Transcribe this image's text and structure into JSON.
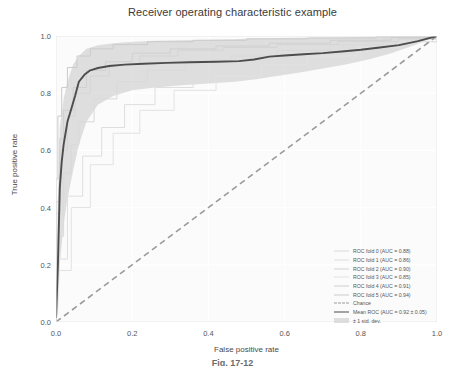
{
  "figure": {
    "caption": "Fig. 17-12"
  },
  "chart_data": {
    "type": "line",
    "title": "Receiver operating characteristic example",
    "xlabel": "False positive rate",
    "ylabel": "True positive rate",
    "xlim": [
      0.0,
      1.0
    ],
    "ylim": [
      0.0,
      1.0
    ],
    "xticks": [
      "0.0",
      "0.2",
      "0.4",
      "0.6",
      "0.8",
      "1.0"
    ],
    "xtick_values": [
      0.0,
      0.2,
      0.4,
      0.6,
      0.8,
      1.0
    ],
    "yticks": [
      "0.0",
      "0.2",
      "0.4",
      "0.6",
      "0.8",
      "1.0"
    ],
    "ytick_values": [
      0.0,
      0.2,
      0.4,
      0.6,
      0.8,
      1.0
    ],
    "grid": true,
    "legend_position": "lower right",
    "series": [
      {
        "name": "ROC fold 0 (AUC = 0.88)",
        "auc": 0.88,
        "style": "solid-light",
        "color": "#d9d9d9",
        "x": [
          0.0,
          0.0,
          0.02,
          0.04,
          0.06,
          0.1,
          0.16,
          0.24,
          0.34,
          0.46,
          0.58,
          0.72,
          0.86,
          1.0
        ],
        "y": [
          0.0,
          0.3,
          0.52,
          0.62,
          0.7,
          0.78,
          0.84,
          0.88,
          0.91,
          0.93,
          0.95,
          0.97,
          0.99,
          1.0
        ]
      },
      {
        "name": "ROC fold 1 (AUC = 0.86)",
        "auc": 0.86,
        "style": "solid-light",
        "color": "#dedede",
        "x": [
          0.0,
          0.0,
          0.03,
          0.07,
          0.12,
          0.18,
          0.26,
          0.36,
          0.48,
          0.6,
          0.74,
          0.88,
          1.0
        ],
        "y": [
          0.0,
          0.22,
          0.44,
          0.58,
          0.68,
          0.76,
          0.82,
          0.87,
          0.9,
          0.93,
          0.96,
          0.98,
          1.0
        ]
      },
      {
        "name": "ROC fold 2 (AUC = 0.90)",
        "auc": 0.9,
        "style": "solid-light",
        "color": "#d4d4d4",
        "x": [
          0.0,
          0.0,
          0.01,
          0.03,
          0.05,
          0.09,
          0.14,
          0.22,
          0.32,
          0.44,
          0.58,
          0.74,
          0.9,
          1.0
        ],
        "y": [
          0.0,
          0.38,
          0.6,
          0.72,
          0.8,
          0.86,
          0.9,
          0.93,
          0.95,
          0.96,
          0.97,
          0.98,
          0.99,
          1.0
        ]
      },
      {
        "name": "ROC fold 3 (AUC = 0.85)",
        "auc": 0.85,
        "style": "solid-light",
        "color": "#e2e2e2",
        "x": [
          0.0,
          0.0,
          0.04,
          0.09,
          0.15,
          0.22,
          0.31,
          0.42,
          0.54,
          0.66,
          0.79,
          0.9,
          1.0
        ],
        "y": [
          0.0,
          0.18,
          0.4,
          0.55,
          0.66,
          0.74,
          0.81,
          0.86,
          0.9,
          0.93,
          0.96,
          0.98,
          1.0
        ]
      },
      {
        "name": "ROC fold 4 (AUC = 0.91)",
        "auc": 0.91,
        "style": "solid-light",
        "color": "#d0d0d0",
        "x": [
          0.0,
          0.0,
          0.01,
          0.02,
          0.045,
          0.08,
          0.13,
          0.2,
          0.3,
          0.42,
          0.56,
          0.72,
          0.88,
          1.0
        ],
        "y": [
          0.0,
          0.42,
          0.64,
          0.74,
          0.82,
          0.88,
          0.91,
          0.94,
          0.955,
          0.965,
          0.975,
          0.985,
          0.995,
          1.0
        ]
      },
      {
        "name": "ROC fold 5 (AUC = 0.94)",
        "auc": 0.94,
        "style": "solid-light",
        "color": "#cbcbcb",
        "x": [
          0.0,
          0.0,
          0.005,
          0.015,
          0.03,
          0.055,
          0.09,
          0.15,
          0.24,
          0.36,
          0.5,
          0.66,
          0.84,
          1.0
        ],
        "y": [
          0.0,
          0.5,
          0.72,
          0.82,
          0.89,
          0.93,
          0.955,
          0.97,
          0.98,
          0.985,
          0.99,
          0.993,
          0.997,
          1.0
        ]
      },
      {
        "name": "Chance",
        "style": "dashed",
        "color": "#9a9a9a",
        "x": [
          0.0,
          1.0
        ],
        "y": [
          0.0,
          1.0
        ]
      },
      {
        "name": "Mean ROC (AUC = 0.92 ± 0.05)",
        "auc": 0.92,
        "auc_std": 0.05,
        "style": "solid-dark",
        "color": "#4d4d4d",
        "x": [
          0.0,
          0.005,
          0.01,
          0.015,
          0.02,
          0.025,
          0.03,
          0.04,
          0.05,
          0.06,
          0.075,
          0.09,
          0.11,
          0.14,
          0.18,
          0.23,
          0.29,
          0.35,
          0.42,
          0.48,
          0.52,
          0.56,
          0.6,
          0.65,
          0.7,
          0.75,
          0.8,
          0.85,
          0.9,
          0.95,
          1.0
        ],
        "y": [
          0.015,
          0.2,
          0.47,
          0.56,
          0.62,
          0.66,
          0.7,
          0.745,
          0.79,
          0.84,
          0.865,
          0.88,
          0.888,
          0.895,
          0.9,
          0.903,
          0.906,
          0.908,
          0.91,
          0.912,
          0.918,
          0.928,
          0.932,
          0.936,
          0.94,
          0.946,
          0.952,
          0.96,
          0.968,
          0.982,
          1.0
        ]
      }
    ],
    "band": {
      "name": "± 1 std. dev.",
      "color": "#c6c6c6",
      "opacity": 0.55,
      "x": [
        0.0,
        0.005,
        0.01,
        0.02,
        0.03,
        0.045,
        0.06,
        0.08,
        0.11,
        0.15,
        0.2,
        0.26,
        0.33,
        0.4,
        0.47,
        0.52,
        0.58,
        0.64,
        0.7,
        0.76,
        0.82,
        0.88,
        0.94,
        1.0
      ],
      "upper": [
        0.12,
        0.43,
        0.68,
        0.78,
        0.84,
        0.9,
        0.93,
        0.955,
        0.968,
        0.975,
        0.98,
        0.983,
        0.985,
        0.987,
        0.989,
        0.992,
        0.993,
        0.994,
        0.995,
        0.996,
        0.997,
        0.998,
        0.999,
        1.0
      ],
      "lower": [
        0.0,
        0.03,
        0.2,
        0.34,
        0.43,
        0.53,
        0.62,
        0.7,
        0.76,
        0.79,
        0.81,
        0.82,
        0.828,
        0.834,
        0.84,
        0.848,
        0.86,
        0.872,
        0.886,
        0.9,
        0.918,
        0.94,
        0.968,
        1.0
      ]
    }
  }
}
